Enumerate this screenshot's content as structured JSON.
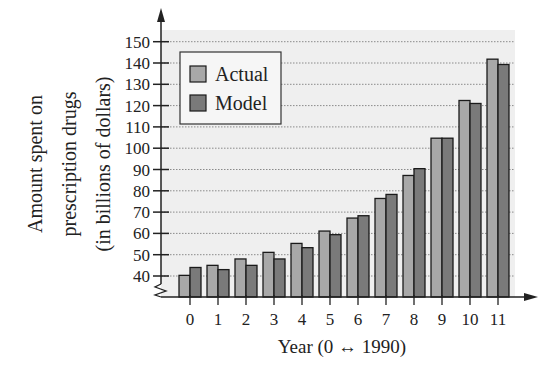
{
  "chart_data": {
    "type": "bar",
    "title": "",
    "xlabel": "Year (0 ↔ 1990)",
    "ylabel_lines": [
      "Amount spent on",
      "prescription drugs",
      "(in billions of dollars)"
    ],
    "ylabel": "Amount spent on prescription drugs (in billions of dollars)",
    "categories": [
      "0",
      "1",
      "2",
      "3",
      "4",
      "5",
      "6",
      "7",
      "8",
      "9",
      "10",
      "11"
    ],
    "series": [
      {
        "name": "Actual",
        "color": "#a8a8a8",
        "values": [
          40.3,
          45.0,
          48.0,
          51.1,
          55.3,
          61.1,
          67.2,
          76.4,
          87.2,
          104.7,
          122.4,
          141.8
        ]
      },
      {
        "name": "Model",
        "color": "#7a7a7a",
        "values": [
          44.0,
          43.0,
          45.0,
          48.0,
          53.3,
          59.4,
          68.3,
          78.3,
          90.4,
          104.7,
          121.0,
          139.3
        ]
      }
    ],
    "yticks": [
      40,
      50,
      60,
      70,
      80,
      90,
      100,
      110,
      120,
      130,
      140,
      150
    ],
    "ylim": [
      33,
      150
    ],
    "axis_break": true,
    "grid": true,
    "grid_style": "dotted horizontal",
    "legend": {
      "position": "upper-left",
      "entries": [
        "Actual",
        "Model"
      ]
    },
    "plot_background": "#efefef"
  }
}
